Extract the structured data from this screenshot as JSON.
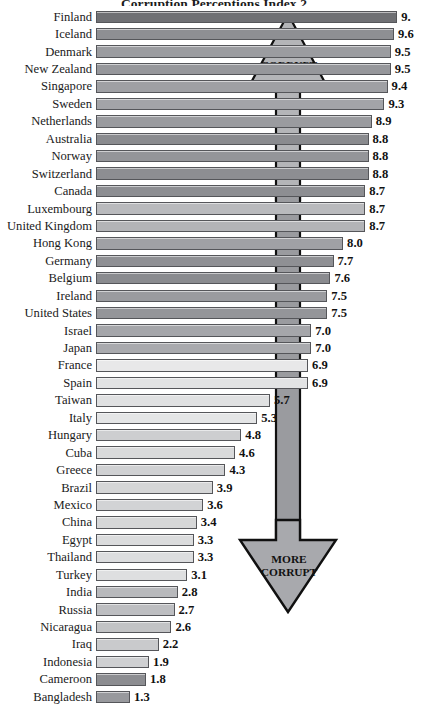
{
  "chart_data": {
    "type": "bar",
    "orientation": "horizontal",
    "title": "Corruption Perceptions Index 2",
    "xlabel": "",
    "ylabel": "",
    "xlim": [
      0,
      10
    ],
    "grid": false,
    "legend": null,
    "value_labels": true,
    "categories": [
      "Finland",
      "Iceland",
      "Denmark",
      "New Zealand",
      "Singapore",
      "Sweden",
      "Netherlands",
      "Australia",
      "Norway",
      "Switzerland",
      "Canada",
      "Luxembourg",
      "United Kingdom",
      "Hong Kong",
      "Germany",
      "Belgium",
      "Ireland",
      "United States",
      "Israel",
      "Japan",
      "France",
      "Spain",
      "Taiwan",
      "Italy",
      "Hungary",
      "Cuba",
      "Greece",
      "Brazil",
      "Mexico",
      "China",
      "Egypt",
      "Thailand",
      "Turkey",
      "India",
      "Russia",
      "Nicaragua",
      "Iraq",
      "Indonesia",
      "Cameroon",
      "Bangladesh"
    ],
    "values": [
      9.7,
      9.6,
      9.5,
      9.5,
      9.4,
      9.3,
      8.9,
      8.8,
      8.8,
      8.8,
      8.7,
      8.7,
      8.7,
      8.0,
      7.7,
      7.6,
      7.5,
      7.5,
      7.0,
      7.0,
      6.9,
      6.9,
      5.7,
      5.3,
      4.8,
      4.6,
      4.3,
      3.9,
      3.6,
      3.4,
      3.3,
      3.3,
      3.1,
      2.8,
      2.7,
      2.6,
      2.2,
      1.9,
      1.8,
      1.3
    ],
    "value_label_text": [
      "9.",
      "9.6",
      "9.5",
      "9.5",
      "9.4",
      "9.3",
      "8.9",
      "8.8",
      "8.8",
      "8.8",
      "8.7",
      "8.7",
      "8.7",
      "8.0",
      "7.7",
      "7.6",
      "7.5",
      "7.5",
      "7.0",
      "7.0",
      "6.9",
      "6.9",
      "5.7",
      "5.3",
      "4.8",
      "4.6",
      "4.3",
      "3.9",
      "3.6",
      "3.4",
      "3.3",
      "3.3",
      "3.1",
      "2.8",
      "2.7",
      "2.6",
      "2.2",
      "1.9",
      "1.8",
      "1.3"
    ],
    "bar_fills": [
      "#6f7074",
      "#8e8f93",
      "#9b9ca0",
      "#96979b",
      "#9fa0a4",
      "#a3a4a8",
      "#9a9b9f",
      "#8a8b8f",
      "#949599",
      "#8d8e92",
      "#8d8e92",
      "#b9babd",
      "#b3b4b7",
      "#a0a1a5",
      "#8f9094",
      "#8a8b8f",
      "#9a9b9f",
      "#949599",
      "#a5a6aa",
      "#a9aaae",
      "#e8e8e9",
      "#e2e3e4",
      "#e0e1e2",
      "#e4e5e6",
      "#cdced0",
      "#d9dadb",
      "#d0d1d3",
      "#d5d6d7",
      "#d2d3d5",
      "#d6d7d8",
      "#dbdcdd",
      "#dcdddf",
      "#dedfe0",
      "#b8b9bc",
      "#bdbec1",
      "#c2c3c5",
      "#c9cacc",
      "#cfd0d2",
      "#8c8d91",
      "#98999d"
    ]
  },
  "annotations": {
    "less_corrupt": "LESS\nCORRUPT",
    "less_corrupt_line1": "LESS",
    "less_corrupt_line2": "CORRUPT",
    "more_corrupt_line1": "MORE",
    "more_corrupt_line2": "CORRUPT",
    "arrow_up_name": "up-arrow-less-corrupt",
    "arrow_down_name": "down-arrow-more-corrupt",
    "arrow_fill": "#a8a9ad",
    "arrow_stroke": "#1a1a1a"
  }
}
